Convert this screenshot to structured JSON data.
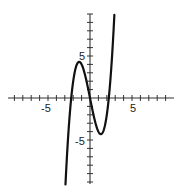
{
  "chart_data": {
    "type": "line",
    "title": "",
    "xlabel": "",
    "ylabel": "",
    "xlim": [
      -10,
      10
    ],
    "ylim": [
      -10,
      10
    ],
    "grid": false,
    "x_tick_labels": [
      "-5",
      "5"
    ],
    "y_tick_labels": [
      "5",
      "-5"
    ],
    "series": [
      {
        "name": "cubic",
        "function": "y = x^3 - 5x (approx.)",
        "x": [
          -2.7,
          -2.24,
          -2,
          -1.29,
          -1,
          0,
          1,
          1.29,
          2,
          2.24,
          2.7
        ],
        "y": [
          -6.2,
          0,
          2,
          4.3,
          4,
          0,
          -4,
          -4.3,
          -2,
          0,
          6.2
        ],
        "features": {
          "local_max": [
            -1.29,
            4.3
          ],
          "local_min": [
            1.29,
            -4.3
          ],
          "x_intercepts": [
            -2.24,
            0,
            2.24
          ]
        }
      }
    ]
  },
  "labels": {
    "x_neg5": "-5",
    "x_pos5": "5",
    "y_pos5": "5",
    "y_neg5": "-5"
  },
  "colors": {
    "axis": "#333333",
    "curve": "#111111"
  }
}
